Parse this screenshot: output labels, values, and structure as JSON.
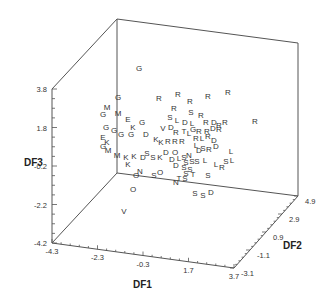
{
  "chart_data": {
    "type": "scatter",
    "subtype": "3d-scatter-labeled",
    "title": "",
    "xlabel": "DF1",
    "ylabel": "DF2",
    "zlabel": "DF3",
    "x_ticks": [
      "-4.3",
      "-2.3",
      "-0.3",
      "1.7",
      "3.7"
    ],
    "y_ticks": [
      "-3.1",
      "-1.1",
      "0.9",
      "2.9",
      "4.9"
    ],
    "z_ticks": [
      "-4.2",
      "-2.2",
      "-0.2",
      "1.8",
      "3.8"
    ],
    "xlim": [
      -4.3,
      3.7
    ],
    "ylim": [
      -3.1,
      4.9
    ],
    "zlim": [
      -4.2,
      3.8
    ],
    "grid": false,
    "legend": "none",
    "point_markers": "category letters",
    "points": [
      {
        "l": "G",
        "px": 139,
        "py": 71
      },
      {
        "l": "G",
        "px": 118,
        "py": 100
      },
      {
        "l": "R",
        "px": 159,
        "py": 101
      },
      {
        "l": "R",
        "px": 178,
        "py": 97
      },
      {
        "l": "R",
        "px": 190,
        "py": 104
      },
      {
        "l": "R",
        "px": 208,
        "py": 99
      },
      {
        "l": "R",
        "px": 228,
        "py": 95
      },
      {
        "l": "R",
        "px": 255,
        "py": 124
      },
      {
        "l": "M",
        "px": 107,
        "py": 110
      },
      {
        "l": "M",
        "px": 118,
        "py": 116
      },
      {
        "l": "G",
        "px": 103,
        "py": 117
      },
      {
        "l": "R",
        "px": 174,
        "py": 111
      },
      {
        "l": "S",
        "px": 191,
        "py": 115
      },
      {
        "l": "R",
        "px": 201,
        "py": 118
      },
      {
        "l": "E",
        "px": 128,
        "py": 122
      },
      {
        "l": "G",
        "px": 142,
        "py": 125
      },
      {
        "l": "S",
        "px": 170,
        "py": 120
      },
      {
        "l": "L",
        "px": 177,
        "py": 123
      },
      {
        "l": "D",
        "px": 185,
        "py": 125
      },
      {
        "l": "L",
        "px": 192,
        "py": 126
      },
      {
        "l": "R",
        "px": 206,
        "py": 125
      },
      {
        "l": "D",
        "px": 214,
        "py": 125
      },
      {
        "l": "R",
        "px": 219,
        "py": 128
      },
      {
        "l": "R",
        "px": 225,
        "py": 125
      },
      {
        "l": "G",
        "px": 106,
        "py": 130
      },
      {
        "l": "G",
        "px": 114,
        "py": 133
      },
      {
        "l": "K",
        "px": 133,
        "py": 130
      },
      {
        "l": "V",
        "px": 163,
        "py": 131
      },
      {
        "l": "D",
        "px": 171,
        "py": 130
      },
      {
        "l": "R",
        "px": 176,
        "py": 135
      },
      {
        "l": "T",
        "px": 184,
        "py": 134
      },
      {
        "l": "L",
        "px": 189,
        "py": 136
      },
      {
        "l": "G",
        "px": 193,
        "py": 132
      },
      {
        "l": "R",
        "px": 199,
        "py": 134
      },
      {
        "l": "R",
        "px": 207,
        "py": 134
      },
      {
        "l": "D",
        "px": 213,
        "py": 131
      },
      {
        "l": "R",
        "px": 219,
        "py": 132
      },
      {
        "l": "E",
        "px": 103,
        "py": 140
      },
      {
        "l": "G",
        "px": 121,
        "py": 137
      },
      {
        "l": "G",
        "px": 131,
        "py": 137
      },
      {
        "l": "D",
        "px": 146,
        "py": 137
      },
      {
        "l": "K",
        "px": 156,
        "py": 142
      },
      {
        "l": "K",
        "px": 161,
        "py": 145
      },
      {
        "l": "R",
        "px": 168,
        "py": 144
      },
      {
        "l": "R",
        "px": 175,
        "py": 144
      },
      {
        "l": "R",
        "px": 182,
        "py": 144
      },
      {
        "l": "R",
        "px": 196,
        "py": 141
      },
      {
        "l": "L",
        "px": 202,
        "py": 141
      },
      {
        "l": "R",
        "px": 208,
        "py": 139
      },
      {
        "l": "D",
        "px": 214,
        "py": 143
      },
      {
        "l": "K",
        "px": 107,
        "py": 145
      },
      {
        "l": "G",
        "px": 103,
        "py": 149
      },
      {
        "l": "M",
        "px": 108,
        "py": 153
      },
      {
        "l": "M",
        "px": 117,
        "py": 158
      },
      {
        "l": "K",
        "px": 126,
        "py": 160
      },
      {
        "l": "K",
        "px": 134,
        "py": 159
      },
      {
        "l": "K",
        "px": 128,
        "py": 167
      },
      {
        "l": "S",
        "px": 147,
        "py": 156
      },
      {
        "l": "D",
        "px": 143,
        "py": 160
      },
      {
        "l": "S",
        "px": 153,
        "py": 160
      },
      {
        "l": "K",
        "px": 160,
        "py": 160
      },
      {
        "l": "L",
        "px": 196,
        "py": 148
      },
      {
        "l": "S",
        "px": 203,
        "py": 151
      },
      {
        "l": "D",
        "px": 199,
        "py": 153
      },
      {
        "l": "R",
        "px": 209,
        "py": 152
      },
      {
        "l": "D",
        "px": 216,
        "py": 149
      },
      {
        "l": "L",
        "px": 231,
        "py": 154
      },
      {
        "l": "D",
        "px": 166,
        "py": 155
      },
      {
        "l": "O",
        "px": 175,
        "py": 155
      },
      {
        "l": "D",
        "px": 172,
        "py": 162
      },
      {
        "l": "L",
        "px": 179,
        "py": 161
      },
      {
        "l": "S",
        "px": 184,
        "py": 160
      },
      {
        "l": "N",
        "px": 189,
        "py": 158
      },
      {
        "l": "S",
        "px": 186,
        "py": 165
      },
      {
        "l": "S",
        "px": 192,
        "py": 164
      },
      {
        "l": "S",
        "px": 197,
        "py": 164
      },
      {
        "l": "L",
        "px": 205,
        "py": 163
      },
      {
        "l": "S",
        "px": 226,
        "py": 164
      },
      {
        "l": "L",
        "px": 232,
        "py": 163
      },
      {
        "l": "L",
        "px": 216,
        "py": 167
      },
      {
        "l": "R",
        "px": 222,
        "py": 170
      },
      {
        "l": "D",
        "px": 176,
        "py": 168
      },
      {
        "l": "S",
        "px": 184,
        "py": 170
      },
      {
        "l": "S",
        "px": 190,
        "py": 172
      },
      {
        "l": "S",
        "px": 186,
        "py": 176
      },
      {
        "l": "T",
        "px": 193,
        "py": 177
      },
      {
        "l": "S",
        "px": 208,
        "py": 178
      },
      {
        "l": "N",
        "px": 140,
        "py": 174
      },
      {
        "l": "O",
        "px": 136,
        "py": 178
      },
      {
        "l": "S",
        "px": 154,
        "py": 178
      },
      {
        "l": "O",
        "px": 160,
        "py": 175
      },
      {
        "l": "N",
        "px": 176,
        "py": 185
      },
      {
        "l": "T",
        "px": 179,
        "py": 181
      },
      {
        "l": "S",
        "px": 185,
        "py": 181
      },
      {
        "l": "S",
        "px": 195,
        "py": 196
      },
      {
        "l": "S",
        "px": 203,
        "py": 198
      },
      {
        "l": "D",
        "px": 211,
        "py": 195
      },
      {
        "l": "O",
        "px": 133,
        "py": 192
      },
      {
        "l": "V",
        "px": 124,
        "py": 214
      }
    ]
  },
  "axes": {
    "x_label": "DF1",
    "y_label": "DF2",
    "z_label": "DF3"
  }
}
